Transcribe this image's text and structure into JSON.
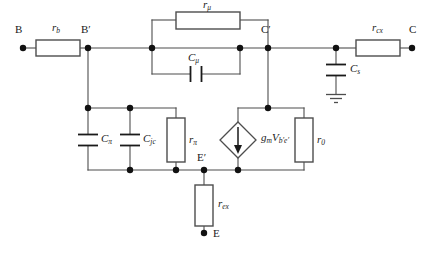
{
  "figure": {
    "type": "circuit-schematic",
    "stroke_color": "#4d4d4d",
    "component_outline_color": "#4d4d4d",
    "node_dot_color": "#111111",
    "background_color": "#ffffff",
    "text_color": "#1a1a1a"
  },
  "terminals": [
    {
      "id": "B",
      "label": "B",
      "x": 18,
      "y": 32
    },
    {
      "id": "C",
      "label": "C",
      "x": 412,
      "y": 32
    },
    {
      "id": "E",
      "label": "E",
      "x": 204,
      "y": 238
    }
  ],
  "nodes": [
    {
      "id": "Bp",
      "label": "B′",
      "x": 88,
      "y": 48
    },
    {
      "id": "Cp",
      "label": "C′",
      "x": 268,
      "y": 48
    },
    {
      "id": "Ep",
      "label": "E′",
      "x": 204,
      "y": 170
    }
  ],
  "components": [
    {
      "id": "rb",
      "kind": "resistor",
      "label": "r",
      "sub": "b",
      "orientation": "horizontal",
      "x": 58,
      "y": 48
    },
    {
      "id": "rmu",
      "kind": "resistor",
      "label": "r",
      "sub": "μ",
      "orientation": "horizontal",
      "x": 208,
      "y": 20
    },
    {
      "id": "Cmu",
      "kind": "capacitor",
      "label": "C",
      "sub": "μ",
      "orientation": "horizontal",
      "x": 196,
      "y": 74
    },
    {
      "id": "rcx",
      "kind": "resistor",
      "label": "r",
      "sub": "cx",
      "orientation": "horizontal",
      "x": 378,
      "y": 32
    },
    {
      "id": "Cs",
      "kind": "capacitor",
      "label": "C",
      "sub": "s",
      "orientation": "vertical",
      "x": 336,
      "y": 70
    },
    {
      "id": "Cpi",
      "kind": "capacitor",
      "label": "C",
      "sub": "π",
      "orientation": "vertical",
      "x": 88,
      "y": 140
    },
    {
      "id": "Cjc",
      "kind": "capacitor",
      "label": "C",
      "sub": "jc",
      "orientation": "vertical",
      "x": 130,
      "y": 140
    },
    {
      "id": "rpi",
      "kind": "resistor",
      "label": "r",
      "sub": "π",
      "orientation": "vertical",
      "x": 176,
      "y": 140
    },
    {
      "id": "r0",
      "kind": "resistor",
      "label": "r",
      "sub": "0",
      "orientation": "vertical",
      "x": 304,
      "y": 140
    },
    {
      "id": "rex",
      "kind": "resistor",
      "label": "r",
      "sub": "ex",
      "orientation": "vertical",
      "x": 204,
      "y": 205
    }
  ],
  "dependent_source": {
    "id": "gm-source",
    "kind": "current-source-diamond",
    "label_prefix": "g",
    "label_prefix_sub": "m",
    "label_main": "V",
    "label_main_sub": "b′e′",
    "full_label": "gmVb′e′",
    "arrow_direction": "down",
    "x": 238,
    "y": 140
  },
  "ground": {
    "id": "ground-symbol",
    "label": "ground",
    "x": 336,
    "y": 96
  },
  "labels": {
    "rb": "r",
    "rb_sub": "b",
    "rmu": "r",
    "rmu_sub": "μ",
    "Cmu": "C",
    "Cmu_sub": "μ",
    "rcx": "r",
    "rcx_sub": "cx",
    "Cs": "C",
    "Cs_sub": "s",
    "Cpi": "C",
    "Cpi_sub": "π",
    "Cjc": "C",
    "Cjc_sub": "jc",
    "rpi": "r",
    "rpi_sub": "π",
    "r0": "r",
    "r0_sub": "0",
    "rex": "r",
    "rex_sub": "ex",
    "gm": "g",
    "gm_sub": "m",
    "V": "V",
    "V_sub": "b′e′",
    "B": "B",
    "Bprime": "B′",
    "C": "C",
    "Cprime": "C′",
    "E": "E",
    "Eprime": "E′"
  }
}
